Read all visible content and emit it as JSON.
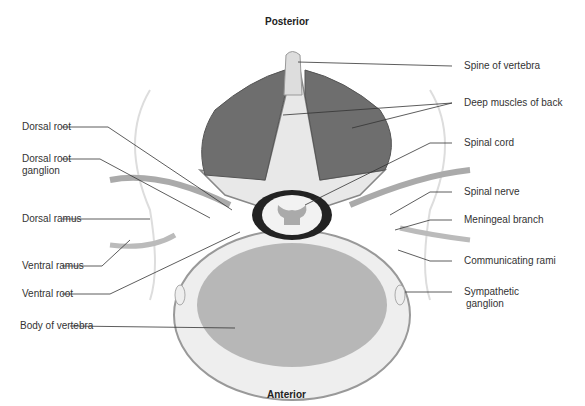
{
  "diagram": {
    "orientation": {
      "top": "Posterior",
      "bottom": "Anterior"
    },
    "labels_left": {
      "dorsal_root": "Dorsal root",
      "drg_line1": "Dorsal root",
      "drg_line2": "ganglion",
      "dorsal_ramus": "Dorsal ramus",
      "ventral_ramus": "Ventral ramus",
      "ventral_root": "Ventral root",
      "body_of_vertebra": "Body of vertebra"
    },
    "labels_right": {
      "spine_of_vertebra": "Spine of vertebra",
      "deep_muscles": "Deep muscles of back",
      "spinal_cord": "Spinal cord",
      "spinal_nerve": "Spinal nerve",
      "meningeal_branch": "Meningeal branch",
      "communicating_rami": "Communicating rami",
      "sympathetic_line1": "Sympathetic",
      "sympathetic_line2": "ganglion"
    }
  }
}
